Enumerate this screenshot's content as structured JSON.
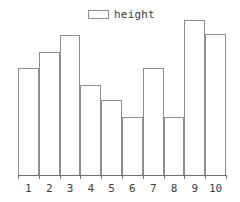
{
  "chart_data": {
    "type": "bar",
    "title": "",
    "subtitle": "",
    "xlabel": "",
    "ylabel": "",
    "categories": [
      "1",
      "2",
      "3",
      "4",
      "5",
      "6",
      "7",
      "8",
      "9",
      "10"
    ],
    "series": [
      {
        "name": "height",
        "values": [
          107,
          123,
          140,
          90,
          75,
          58,
          107,
          58,
          155,
          141
        ]
      }
    ],
    "values": [
      107,
      123,
      140,
      90,
      75,
      58,
      107,
      58,
      155,
      141
    ],
    "ylim": [
      0,
      157
    ],
    "grid": false,
    "legend": {
      "position": "top-center",
      "entries": [
        {
          "label": "height",
          "swatch": "open-rectangle",
          "color": "#8d8d8d"
        }
      ]
    },
    "axis": {
      "x_ticks": [
        "1",
        "2",
        "3",
        "4",
        "5",
        "6",
        "7",
        "8",
        "9",
        "10"
      ],
      "y_ticks": [],
      "x_axis_visible": true,
      "y_axis_visible": false
    },
    "style": {
      "bar_fill": "#ffffff",
      "bar_edge": "#8d8d8d",
      "axis_color": "#6f6f6f",
      "text_color": "#3d3d3d",
      "background": "#ffffff"
    }
  }
}
